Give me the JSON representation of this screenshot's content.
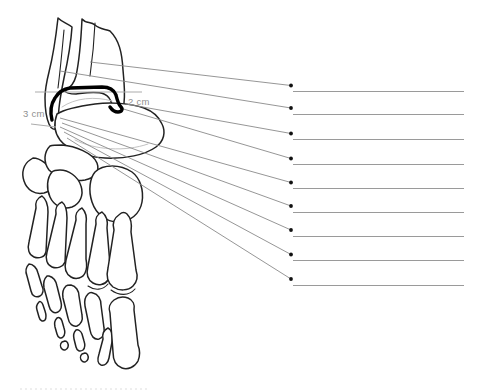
{
  "diagram": {
    "measurement_labels": [
      {
        "id": "left",
        "text": "3 cm"
      },
      {
        "id": "right",
        "text": "2 cm"
      }
    ],
    "answer_lines": [
      {
        "index": 1,
        "value": ""
      },
      {
        "index": 2,
        "value": ""
      },
      {
        "index": 3,
        "value": ""
      },
      {
        "index": 4,
        "value": ""
      },
      {
        "index": 5,
        "value": ""
      },
      {
        "index": 6,
        "value": ""
      },
      {
        "index": 7,
        "value": ""
      },
      {
        "index": 8,
        "value": ""
      },
      {
        "index": 9,
        "value": ""
      }
    ],
    "colors": {
      "background": "#ffffff",
      "bone_outline": "#222222",
      "mortise_highlight": "#000000",
      "leader_line": "#8a8a8a",
      "answer_line": "#9a9a9a",
      "measurement_line": "#ababab",
      "label_text": "#8f8f8f",
      "dot": "#111111"
    }
  }
}
